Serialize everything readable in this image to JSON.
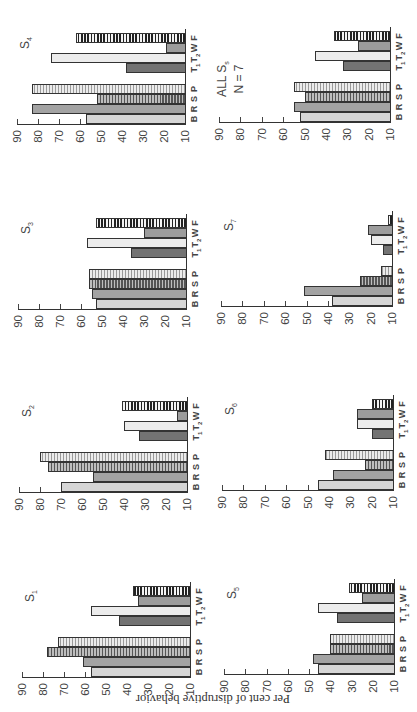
{
  "chart_data": {
    "type": "bar",
    "ylabel": "Per cent of disruptive behavior",
    "xlabel": "",
    "ylim": [
      10,
      90
    ],
    "yticks": [
      10,
      20,
      30,
      40,
      50,
      60,
      70,
      80,
      90
    ],
    "categories": [
      "B",
      "R",
      "S",
      "P",
      "T1",
      "T2",
      "W",
      "F"
    ],
    "category_labels": [
      {
        "main": "B",
        "sub": ""
      },
      {
        "main": "R",
        "sub": ""
      },
      {
        "main": "S",
        "sub": ""
      },
      {
        "main": "P",
        "sub": ""
      },
      {
        "main": "T",
        "sub": "1"
      },
      {
        "main": "T",
        "sub": "2"
      },
      {
        "main": "W",
        "sub": ""
      },
      {
        "main": "F",
        "sub": ""
      }
    ],
    "grid": false,
    "orientation_note": "figure page rotated 90 degrees counter-clockwise",
    "panels": [
      {
        "title": "S",
        "title_sub": "1",
        "title_line2": "",
        "values": [
          57,
          61,
          78,
          73,
          44,
          57,
          35,
          37
        ]
      },
      {
        "title": "S",
        "title_sub": "2",
        "title_line2": "",
        "values": [
          70,
          55,
          76,
          80,
          33,
          40,
          15,
          41
        ]
      },
      {
        "title": "S",
        "title_sub": "3",
        "title_line2": "",
        "values": [
          53,
          55,
          56,
          56,
          36,
          57,
          30,
          53
        ]
      },
      {
        "title": "S",
        "title_sub": "4",
        "title_line2": "",
        "values": [
          57,
          83,
          52,
          83,
          38,
          74,
          19,
          62
        ]
      },
      {
        "title": "S",
        "title_sub": "5",
        "title_line2": "",
        "values": [
          46,
          48,
          40,
          40,
          37,
          46,
          25,
          31
        ]
      },
      {
        "title": "S",
        "title_sub": "6",
        "title_line2": "",
        "values": [
          45,
          38,
          23,
          42,
          20,
          27,
          27,
          20
        ]
      },
      {
        "title": "S",
        "title_sub": "7",
        "title_line2": "",
        "values": [
          38,
          51,
          25,
          15,
          14,
          20,
          21,
          12
        ]
      },
      {
        "title": "ALL S",
        "title_sub": "s",
        "title_line2": "N = 7",
        "values": [
          52,
          55,
          50,
          55,
          32,
          45,
          25,
          36
        ]
      }
    ]
  }
}
